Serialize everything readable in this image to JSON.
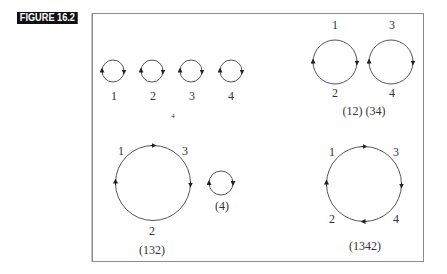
{
  "figure": {
    "label": "FIGURE 16.2",
    "colors": {
      "label_bg": "#111111",
      "label_fg": "#ffffff",
      "stroke": "#555555",
      "frame": "#8a8a8a"
    }
  },
  "panels": {
    "identity": {
      "nodes": [
        {
          "label": "1",
          "cx": 113,
          "cy": 71,
          "r": 11,
          "lx": 114,
          "ly": 99
        },
        {
          "label": "2",
          "cx": 152,
          "cy": 71,
          "r": 11,
          "lx": 153,
          "ly": 99
        },
        {
          "label": "3",
          "cx": 191,
          "cy": 71,
          "r": 11,
          "lx": 192,
          "ly": 99
        },
        {
          "label": "4",
          "cx": 231,
          "cy": 71,
          "r": 11,
          "lx": 231,
          "ly": 99
        }
      ],
      "caption": "4"
    },
    "pair_swap": {
      "cycles": [
        {
          "top": "1",
          "bottom": "2",
          "cx": 335,
          "cy": 62,
          "r": 22
        },
        {
          "top": "3",
          "bottom": "4",
          "cx": 391,
          "cy": 62,
          "r": 22
        }
      ],
      "caption": "(12) (34)"
    },
    "three_cycle": {
      "labels": {
        "top_left": "1",
        "top_right": "3",
        "bottom": "2"
      },
      "caption": "(132)",
      "fixed_point": {
        "label": "(4)"
      }
    },
    "four_cycle": {
      "labels": {
        "top_left": "1",
        "top_right": "3",
        "bottom_left": "2",
        "bottom_right": "4"
      },
      "caption": "(1342)"
    }
  }
}
